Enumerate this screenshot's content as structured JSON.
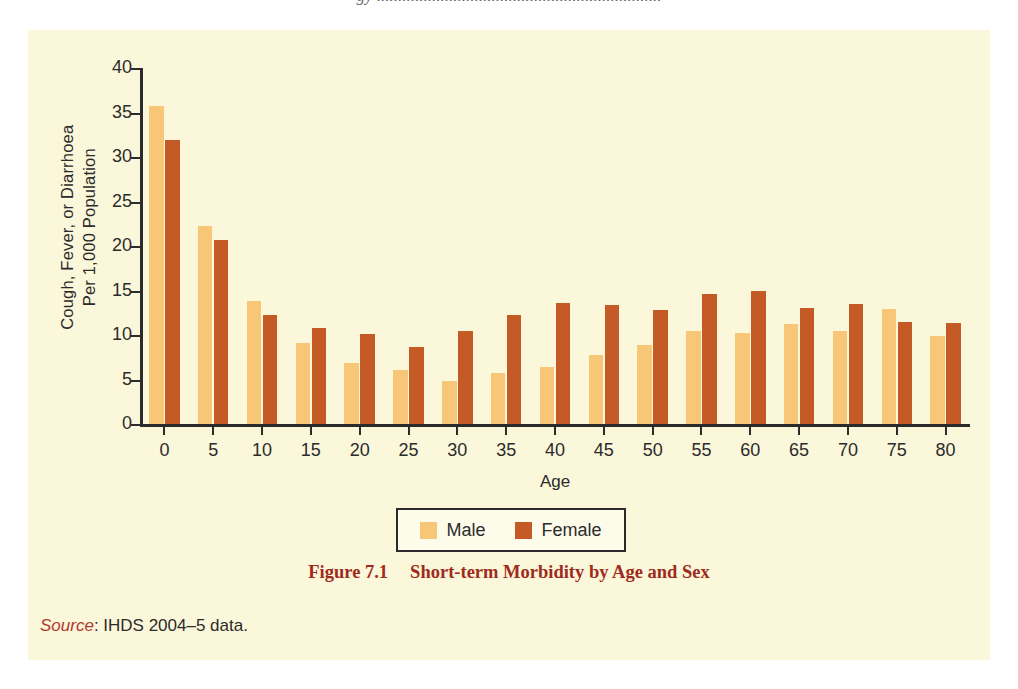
{
  "page": {
    "bleed_text": "gy ...................................................................",
    "panel_color": "#FBF7DA"
  },
  "caption": {
    "number": "Figure 7.1",
    "title": "Short-term Morbidity by Age and Sex",
    "color": "#9E2B20"
  },
  "source": {
    "label": "Source",
    "separator": ": ",
    "text": "IHDS 2004–5 data."
  },
  "legend": {
    "items": [
      {
        "label": "Male",
        "color": "#F7C777"
      },
      {
        "label": "Female",
        "color": "#C45A26"
      }
    ]
  },
  "chart_data": {
    "type": "bar",
    "title": "Short-term Morbidity by Age and Sex",
    "xlabel": "Age",
    "ylabel": "Cough, Fever, or Diarrhoea Per 1,000 Population",
    "ylabel_line1": "Cough, Fever, or Diarrhoea",
    "ylabel_line2": "Per 1,000 Population",
    "ylim": [
      0,
      40
    ],
    "yticks": [
      0,
      5,
      10,
      15,
      20,
      25,
      30,
      35,
      40
    ],
    "grid": false,
    "legend_position": "bottom-center",
    "categories": [
      "0",
      "5",
      "10",
      "15",
      "20",
      "25",
      "30",
      "35",
      "40",
      "45",
      "50",
      "55",
      "60",
      "65",
      "70",
      "75",
      "80"
    ],
    "series": [
      {
        "name": "Male",
        "color": "#F7C777",
        "values": [
          35.7,
          22.2,
          13.8,
          9.1,
          6.8,
          6.1,
          4.8,
          5.7,
          6.4,
          7.8,
          8.9,
          10.4,
          10.2,
          11.2,
          10.5,
          12.9,
          9.9
        ]
      },
      {
        "name": "Female",
        "color": "#C45A26",
        "values": [
          31.9,
          20.7,
          12.3,
          10.8,
          10.1,
          8.7,
          10.4,
          12.3,
          13.6,
          13.4,
          12.8,
          14.6,
          14.9,
          13.0,
          13.5,
          11.5,
          11.3
        ]
      }
    ]
  }
}
